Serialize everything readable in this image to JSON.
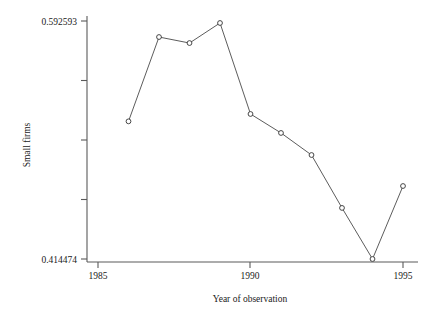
{
  "chart_data": {
    "type": "line",
    "title": "",
    "xlabel": "Year of observation",
    "ylabel": "Small firms",
    "x": [
      1986,
      1987,
      1988,
      1989,
      1990,
      1991,
      1992,
      1993,
      1994,
      1995
    ],
    "values": [
      0.5175,
      0.5806,
      0.5761,
      0.5911,
      0.523,
      0.5088,
      0.4923,
      0.4527,
      0.414474,
      0.4691
    ],
    "series": [
      {
        "name": "Small firms",
        "values": [
          0.5175,
          0.5806,
          0.5761,
          0.5911,
          0.523,
          0.5088,
          0.4923,
          0.4527,
          0.414474,
          0.4691
        ]
      }
    ],
    "xlim": [
      1985,
      1995
    ],
    "ylim": [
      0.414474,
      0.592593
    ],
    "xticks": [
      1985,
      1990,
      1995
    ],
    "xtick_labels": [
      "1985",
      "1990",
      "1995"
    ],
    "yticks": [
      0.414474,
      0.459004,
      0.503534,
      0.548063,
      0.592593
    ],
    "ytick_labels": [
      "0.414474",
      "",
      "",
      "",
      "0.592593"
    ],
    "ytick_labels_visible": [
      "0.592593",
      "0.414474"
    ],
    "grid": false,
    "legend": false,
    "marker": "open-circle",
    "line_color": "#4a4a4a",
    "marker_fill": "#ffffff",
    "marker_stroke": "#333333",
    "axis_color": "#5a5a5a",
    "background": "#ffffff"
  },
  "axes": {
    "y_top_label": "0.592593",
    "y_bottom_label": "0.414474",
    "y_title": "Small firms",
    "x_title": "Year of observation",
    "x_labels": [
      "1985",
      "1990",
      "1995"
    ]
  }
}
